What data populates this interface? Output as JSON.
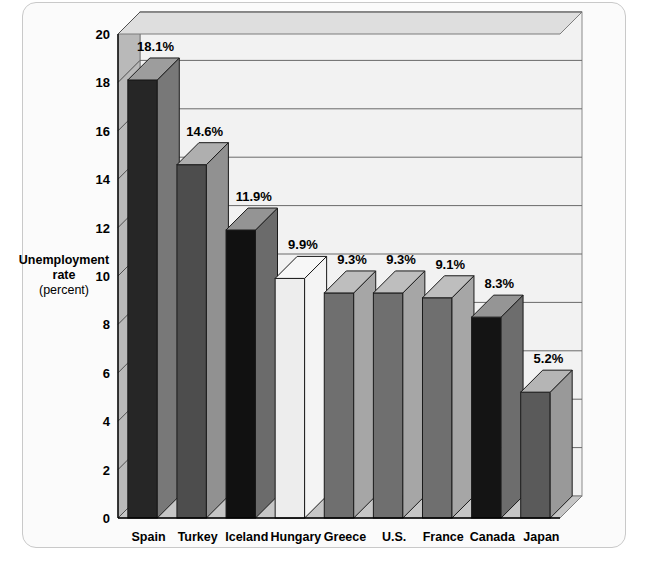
{
  "chart_data": {
    "type": "bar",
    "title": "",
    "subtitle": "",
    "xlabel": "",
    "ylabel": "Unemployment rate",
    "ylabel_unit": "(percent)",
    "ylabel_line1": "Unemployment",
    "ylabel_line2": "rate",
    "ylim": [
      0,
      20
    ],
    "ytick_step": 2,
    "yticks": [
      "0",
      "2",
      "4",
      "6",
      "8",
      "10",
      "12",
      "14",
      "16",
      "18",
      "20"
    ],
    "grid": true,
    "legend": "none",
    "style": "3d-bar",
    "categories": [
      "Spain",
      "Turkey",
      "Iceland",
      "Hungary",
      "Greece",
      "U.S.",
      "France",
      "Canada",
      "Japan"
    ],
    "values": [
      18.1,
      14.6,
      11.9,
      9.9,
      9.3,
      9.3,
      9.1,
      8.3,
      5.2
    ],
    "value_labels": [
      "18.1%",
      "14.6%",
      "11.9%",
      "9.9%",
      "9.3%",
      "9.3%",
      "9.1%",
      "8.3%",
      "5.2%"
    ],
    "bar_colors": [
      "#262626",
      "#4d4d4d",
      "#111111",
      "#ededed",
      "#6f6f6f",
      "#6f6f6f",
      "#6f6f6f",
      "#141414",
      "#5a5a5a"
    ]
  },
  "colors": {
    "page_background": "#ffffff",
    "frame_background": "#fbfbfb",
    "frame_border": "#c9c9c9",
    "plot_floor": "#c6c6c6",
    "plot_wall": "#b9b9b9",
    "plot_back": "#f2f2f2",
    "gridline": "#6a6a6a",
    "axis_line": "#000000",
    "bar_top_tint": "#ffffff",
    "bar_side_tint": "#000000"
  }
}
